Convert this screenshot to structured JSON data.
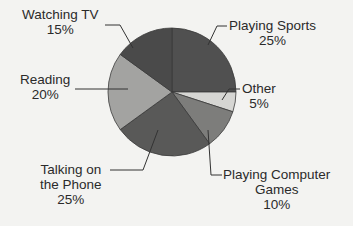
{
  "chart_data": {
    "type": "pie",
    "title": "",
    "start_angle_deg": 0,
    "direction": "clockwise",
    "slices": [
      {
        "label": "Playing Sports",
        "value": 25,
        "pct_label": "25%",
        "color": "#505050"
      },
      {
        "label": "Other",
        "value": 5,
        "pct_label": "5%",
        "color": "#d6d6d3"
      },
      {
        "label": "Playing Computer Games",
        "value": 10,
        "pct_label": "10%",
        "color": "#7d7d7b"
      },
      {
        "label": "Talking on the Phone",
        "value": 25,
        "pct_label": "25%",
        "color": "#595958"
      },
      {
        "label": "Reading",
        "value": 20,
        "pct_label": "20%",
        "color": "#a3a3a1"
      },
      {
        "label": "Watching TV",
        "value": 15,
        "pct_label": "15%",
        "color": "#4a4a4a"
      }
    ],
    "legend": "none (callout labels)"
  },
  "labels": {
    "sports": {
      "line1": "Playing Sports",
      "line2": "25%"
    },
    "other": {
      "line1": "Other",
      "line2": "5%"
    },
    "games": {
      "line1": "Playing Computer",
      "line2": "Games",
      "line3": "10%"
    },
    "phone": {
      "line1": "Talking on",
      "line2": "the Phone",
      "line3": "25%"
    },
    "reading": {
      "line1": "Reading",
      "line2": "20%"
    },
    "tv": {
      "line1": "Watching TV",
      "line2": "15%"
    }
  }
}
